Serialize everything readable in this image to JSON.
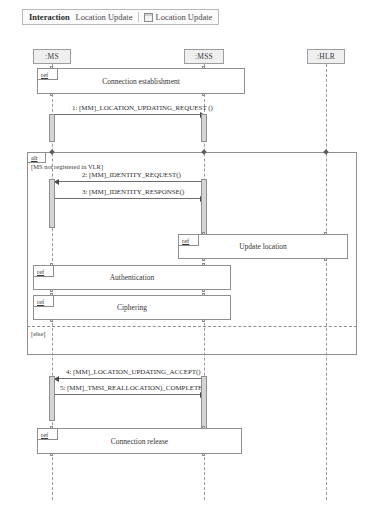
{
  "header": {
    "kind_label": "Interaction",
    "interaction_name": "Location Update",
    "tab_icon": "diagram-icon",
    "tab_label": "Location Update"
  },
  "lifelines": [
    {
      "id": "ms",
      "label": ":MS",
      "x": 52
    },
    {
      "id": "mss",
      "label": ":MSS",
      "x": 204
    },
    {
      "id": "hlr",
      "label": ":HLR",
      "x": 326
    }
  ],
  "fragment": {
    "operator": "alt",
    "guard_first": "[MS not registered in VLR]",
    "guard_second": "[else]"
  },
  "ref_frames": [
    {
      "id": "connection-establishment",
      "tag": "ref",
      "label": "Connection establishment"
    },
    {
      "id": "update-location",
      "tag": "ref",
      "label": "Update location"
    },
    {
      "id": "authentication",
      "tag": "ref",
      "label": "Authentication"
    },
    {
      "id": "ciphering",
      "tag": "ref",
      "label": "Ciphering"
    },
    {
      "id": "connection-release",
      "tag": "ref",
      "label": "Connection release"
    }
  ],
  "messages": [
    {
      "seq": "1",
      "label": "1: [MM]_LOCATION_UPDATING_REQUEST ()",
      "from": "ms",
      "to": "mss",
      "direction": "to-right"
    },
    {
      "seq": "2",
      "label": "2: [MM]_IDENTITY_REQUEST()",
      "from": "mss",
      "to": "ms",
      "direction": "to-left"
    },
    {
      "seq": "3",
      "label": "3: [MM]_IDENTITY_RESPONSE()",
      "from": "ms",
      "to": "mss",
      "direction": "to-right"
    },
    {
      "seq": "4",
      "label": "4: [MM]_LOCATION_UPDATING_ACCEPT()",
      "from": "mss",
      "to": "ms",
      "direction": "to-left"
    },
    {
      "seq": "5",
      "label": "5: [MM]_TMSI_REALLOCATION)_COMPLETE()",
      "from": "ms",
      "to": "mss",
      "direction": "to-right"
    }
  ],
  "colors": {
    "line": "#8f8f8f",
    "activation_fill": "#d4d4d4",
    "lifeline_head_fill": "#efefef",
    "text": "#333333"
  }
}
